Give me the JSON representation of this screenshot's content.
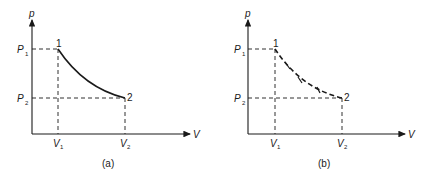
{
  "figure": {
    "panels": [
      {
        "id": "a",
        "caption": "(a)",
        "y_axis_label": "p",
        "x_axis_label": "V",
        "p1_label": "P",
        "p1_sub": "1",
        "p2_label": "P",
        "p2_sub": "2",
        "v1_label": "V",
        "v1_sub": "1",
        "v2_label": "V",
        "v2_sub": "2",
        "state1_label": "1",
        "state2_label": "2",
        "curve_style": "solid",
        "curve_meaning": "quasi-equilibrium (reversible) process"
      },
      {
        "id": "b",
        "caption": "(b)",
        "y_axis_label": "p",
        "x_axis_label": "V",
        "p1_label": "P",
        "p1_sub": "1",
        "p2_label": "P",
        "p2_sub": "2",
        "v1_label": "V",
        "v1_sub": "1",
        "v2_label": "V",
        "v2_sub": "2",
        "state1_label": "1",
        "state2_label": "2",
        "curve_style": "dashed-with-ticks",
        "curve_meaning": "non-equilibrium (irreversible) process"
      }
    ],
    "colors": {
      "ink": "#1a1a1a",
      "background": "#ffffff"
    }
  }
}
